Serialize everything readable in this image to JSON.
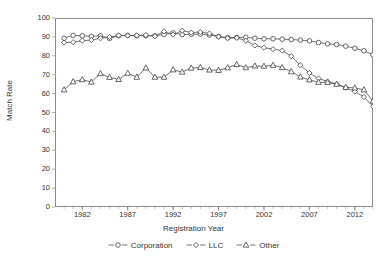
{
  "chart_data": {
    "type": "line",
    "title": "",
    "xlabel": "Registration Year",
    "ylabel": "Match Rate",
    "xlim": [
      1979,
      2014
    ],
    "ylim": [
      0,
      100
    ],
    "ytick_values": [
      0,
      10,
      20,
      30,
      40,
      50,
      60,
      70,
      80,
      90,
      100
    ],
    "ytick_labels": [
      "0",
      "10",
      "20",
      "30",
      "40",
      "50",
      "60",
      "70",
      "80",
      "90",
      "100"
    ],
    "xtick_values": [
      1982,
      1987,
      1992,
      1997,
      2002,
      2007,
      2012
    ],
    "xtick_labels": [
      "1982",
      "1987",
      "1992",
      "1997",
      "2002",
      "2007",
      "2012"
    ],
    "grid": false,
    "legend_position": "bottom",
    "x": [
      1980,
      1981,
      1982,
      1983,
      1984,
      1985,
      1986,
      1987,
      1988,
      1989,
      1990,
      1991,
      1992,
      1993,
      1994,
      1995,
      1996,
      1997,
      1998,
      1999,
      2000,
      2001,
      2002,
      2003,
      2004,
      2005,
      2006,
      2007,
      2008,
      2009,
      2010,
      2011,
      2012,
      2013,
      2014
    ],
    "series": [
      {
        "name": "Corporation",
        "marker": "circle",
        "color": "#4d4d4d",
        "values": [
          89.3,
          90.8,
          90.6,
          90.3,
          90.6,
          89.2,
          90.6,
          90.8,
          90.6,
          90.6,
          90.6,
          91.3,
          92.1,
          91.2,
          91.4,
          91.5,
          91.0,
          90.2,
          89.6,
          89.7,
          89.8,
          89.3,
          89.0,
          89.0,
          88.8,
          88.6,
          88.3,
          87.9,
          87.0,
          86.3,
          86.0,
          85.1,
          84.0,
          82.7,
          80.5
        ]
      },
      {
        "name": "LLC",
        "marker": "diamond",
        "color": "#4d4d4d",
        "values": [
          87.0,
          87.2,
          88.0,
          88.3,
          89.3,
          89.9,
          90.8,
          90.7,
          90.8,
          91.0,
          90.4,
          92.9,
          91.2,
          93.3,
          92.3,
          92.6,
          91.8,
          90.1,
          89.3,
          89.5,
          88.0,
          85.5,
          84.3,
          83.5,
          82.8,
          79.8,
          75.0,
          70.9,
          68.0,
          66.4,
          65.0,
          63.1,
          61.1,
          58.2,
          53.2
        ]
      },
      {
        "name": "Other",
        "marker": "triangle",
        "color": "#4d4d4d",
        "values": [
          62.0,
          66.3,
          67.4,
          66.1,
          70.6,
          68.6,
          67.5,
          70.8,
          68.7,
          73.6,
          68.7,
          68.7,
          72.6,
          71.4,
          73.5,
          73.8,
          72.5,
          72.3,
          73.7,
          75.4,
          73.7,
          74.6,
          74.5,
          75.0,
          73.8,
          71.6,
          68.8,
          67.3,
          66.0,
          65.9,
          65.0,
          63.3,
          63.0,
          62.0,
          56.0
        ]
      }
    ]
  }
}
